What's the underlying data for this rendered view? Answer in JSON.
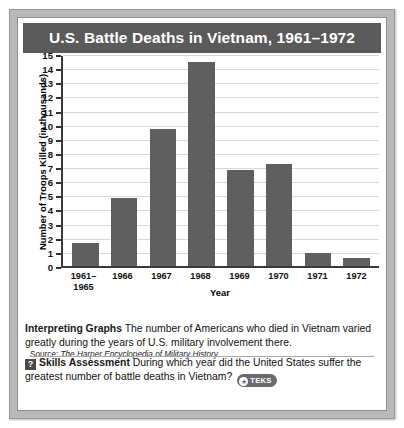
{
  "figure": {
    "title": "U.S. Battle Deaths in Vietnam, 1961–1972",
    "source_prefix": "Source: ",
    "source_title": "The Harper Encyclopedia of Military History"
  },
  "caption": {
    "interpreting_label": "Interpreting Graphs",
    "interpreting_text": " The number of Americans who died in Vietnam varied greatly during the years of U.S. military involvement there.",
    "question_icon": "?",
    "skills_label": "Skills Assessment",
    "skills_text": " During which year did the United States suffer the greatest number of battle deaths in Vietnam?",
    "teks_star": "★",
    "teks_text": "TEKS"
  },
  "colors": {
    "bar": "#5f5f5f",
    "title_banner": "#5a5a5a",
    "frame": "#b9b9b9",
    "axis": "#3a3a3a",
    "gridline": "#d8d8d8"
  },
  "chart_data": {
    "type": "bar",
    "title": "U.S. Battle Deaths in Vietnam, 1961–1972",
    "xlabel": "Year",
    "ylabel": "Number of Troops Killed (in thousands)",
    "categories": [
      "1961–\n1965",
      "1966",
      "1967",
      "1968",
      "1969",
      "1970",
      "1971",
      "1972"
    ],
    "values": [
      1.6,
      4.8,
      9.7,
      14.4,
      6.8,
      7.2,
      0.9,
      0.6
    ],
    "ylim": [
      0,
      15
    ],
    "yticks": [
      0,
      1,
      2,
      3,
      4,
      5,
      6,
      7,
      8,
      9,
      10,
      11,
      12,
      13,
      14,
      15
    ],
    "ytick_labels": [
      "0",
      "1",
      "2",
      "3",
      "4",
      "5",
      "6",
      "7",
      "8",
      "9",
      "10",
      "11",
      "12",
      "13",
      "14",
      "15"
    ],
    "grid": true,
    "legend": null,
    "series": [
      {
        "name": "U.S. battle deaths (thousands)",
        "values": [
          1.6,
          4.8,
          9.7,
          14.4,
          6.8,
          7.2,
          0.9,
          0.6
        ]
      }
    ]
  }
}
